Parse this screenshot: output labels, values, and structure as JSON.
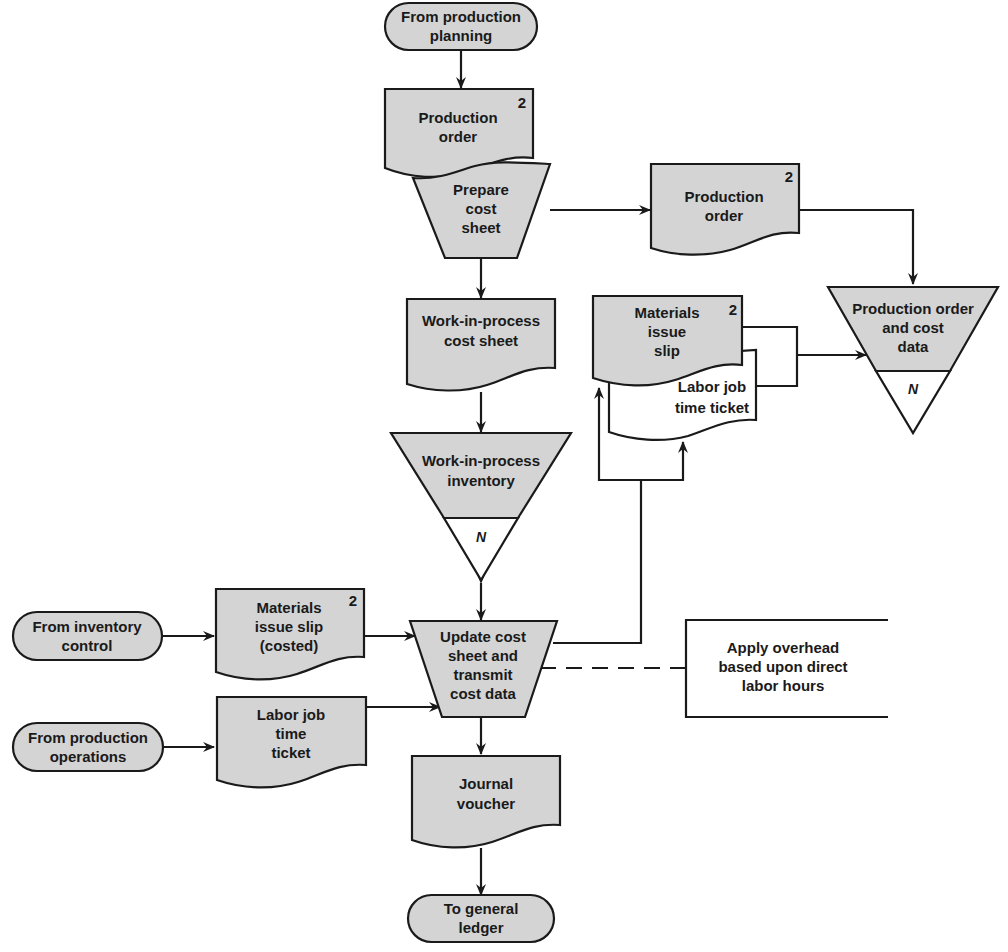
{
  "diagram": {
    "type": "flowchart",
    "colors": {
      "shape_fill": "#d4d4d4",
      "stroke": "#1a1a1a",
      "background": "#ffffff"
    },
    "terminals": {
      "from_production_planning": [
        "From production",
        "planning"
      ],
      "from_inventory_control": [
        "From inventory",
        "control"
      ],
      "from_production_operations": [
        "From production",
        "operations"
      ],
      "to_general_ledger": [
        "To general",
        "ledger"
      ]
    },
    "documents": {
      "production_order_top": {
        "lines": [
          "Production",
          "order"
        ],
        "copies": "2"
      },
      "production_order_right": {
        "lines": [
          "Production",
          "order"
        ],
        "copies": "2"
      },
      "wip_cost_sheet": {
        "lines": [
          "Work-in-process",
          "cost sheet"
        ]
      },
      "materials_issue_slip": {
        "lines": [
          "Materials",
          "issue",
          "slip"
        ],
        "copies": "2"
      },
      "labor_job_time_ticket_stack": {
        "lines": [
          "Labor job",
          "time ticket"
        ]
      },
      "materials_issue_slip_costed": {
        "lines": [
          "Materials",
          "issue slip",
          "(costed)"
        ],
        "copies": "2"
      },
      "labor_job_time_ticket": {
        "lines": [
          "Labor job",
          "time",
          "ticket"
        ]
      },
      "journal_voucher": {
        "lines": [
          "Journal",
          "voucher"
        ]
      }
    },
    "processes": {
      "prepare_cost_sheet": [
        "Prepare",
        "cost",
        "sheet"
      ],
      "update_cost_sheet": [
        "Update cost",
        "sheet and",
        "transmit",
        "cost data"
      ]
    },
    "files": {
      "wip_inventory": {
        "lines": [
          "Work-in-process",
          "inventory"
        ],
        "order": "N"
      },
      "production_order_cost_data": {
        "lines": [
          "Production order",
          "and cost",
          "data"
        ],
        "order": "N"
      }
    },
    "annotation": [
      "Apply overhead",
      "based upon direct",
      "labor hours"
    ]
  }
}
